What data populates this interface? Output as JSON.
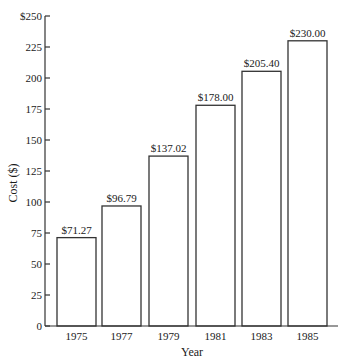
{
  "chart_data": {
    "type": "bar",
    "title": "",
    "xlabel": "Year",
    "ylabel": "Cost ($)",
    "categories": [
      "1975",
      "1977",
      "1979",
      "1981",
      "1983",
      "1985"
    ],
    "values": [
      71.27,
      96.79,
      137.02,
      178.0,
      205.4,
      230.0
    ],
    "data_labels": [
      "$71.27",
      "$96.79",
      "$137.02",
      "$178.00",
      "$205.40",
      "$230.00"
    ],
    "ylim": [
      0,
      250
    ],
    "yticks": [
      0,
      25,
      50,
      75,
      100,
      125,
      150,
      175,
      200,
      225,
      250
    ],
    "ytick_labels": [
      "0",
      "25",
      "50",
      "75",
      "100",
      "125",
      "150",
      "175",
      "200",
      "225",
      "$250"
    ],
    "grid": false,
    "legend": null,
    "bar_fill": "#ffffff",
    "bar_stroke": "#333333"
  }
}
